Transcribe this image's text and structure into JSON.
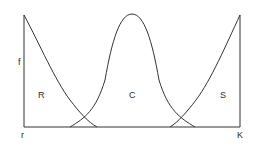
{
  "diagram": {
    "type": "selection-strategy curves",
    "y_axis_label": "f",
    "x_axis_start_label": "r",
    "x_axis_end_label": "K",
    "regions": [
      {
        "label": "R",
        "shape": "decreasing from left"
      },
      {
        "label": "C",
        "shape": "bell-shaped center"
      },
      {
        "label": "S",
        "shape": "increasing to right"
      }
    ],
    "line_color": "#333333",
    "background": "#ffffff"
  }
}
